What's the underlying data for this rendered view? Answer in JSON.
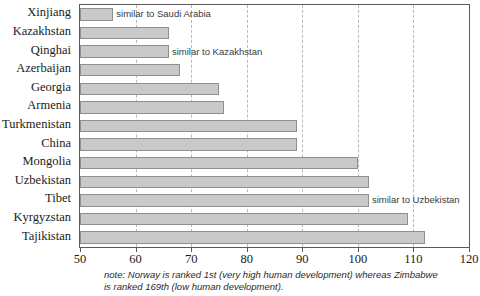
{
  "chart_data": {
    "type": "bar",
    "orientation": "horizontal",
    "title": "",
    "xlabel": "",
    "ylabel": "",
    "xlim": [
      50,
      120
    ],
    "xticks": [
      50,
      60,
      70,
      80,
      90,
      100,
      110,
      120
    ],
    "grid": true,
    "gridlines_at": [
      60,
      70,
      80,
      90,
      100,
      110
    ],
    "legend": null,
    "categories": [
      "Xinjiang",
      "Kazakhstan",
      "Qinghai",
      "Azerbaijan",
      "Georgia",
      "Armenia",
      "Turkmenistan",
      "China",
      "Mongolia",
      "Uzbekistan",
      "Tibet",
      "Kyrgyzstan",
      "Tajikistan"
    ],
    "values": [
      56,
      66,
      66,
      68,
      75,
      76,
      89,
      89,
      100,
      102,
      102,
      109,
      112
    ],
    "annotations": [
      {
        "category": "Xinjiang",
        "text": "similar to Saudi Arabia"
      },
      {
        "category": "Qinghai",
        "text": "similar to Kazakhstan"
      },
      {
        "category": "Tibet",
        "text": "similar to Uzbekistan"
      }
    ],
    "bar_color": "#c9c9c9",
    "bar_border_color": "#8f8f8f",
    "axis_color": "#5a5a5a",
    "gridline_color": "#b9b9b9"
  },
  "footnote": {
    "text": "note: Norway is ranked 1st (very high human development) whereas Zimbabwe is ranked 169th (low human development)."
  }
}
